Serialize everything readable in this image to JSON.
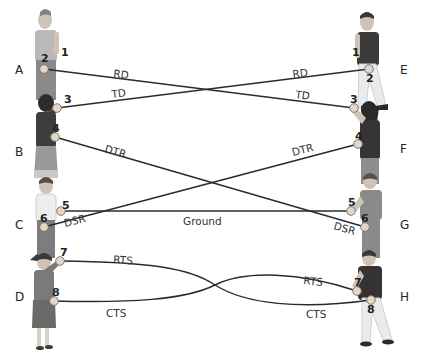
{
  "diagram": {
    "left_rows": [
      {
        "letter": "A",
        "x": 15,
        "y": 74
      },
      {
        "letter": "B",
        "x": 15,
        "y": 156
      },
      {
        "letter": "C",
        "x": 15,
        "y": 229
      },
      {
        "letter": "D",
        "x": 15,
        "y": 301
      }
    ],
    "right_rows": [
      {
        "letter": "E",
        "x": 400,
        "y": 74
      },
      {
        "letter": "F",
        "x": 400,
        "y": 153
      },
      {
        "letter": "G",
        "x": 400,
        "y": 229
      },
      {
        "letter": "H",
        "x": 400,
        "y": 301
      }
    ],
    "left_pins": [
      {
        "num": "1",
        "label_x": 61,
        "label_y": 56,
        "x": null,
        "y": null
      },
      {
        "num": "2",
        "label_x": 41,
        "label_y": 62,
        "x": 44,
        "y": 69
      },
      {
        "num": "3",
        "label_x": 64,
        "label_y": 103,
        "x": 57,
        "y": 108
      },
      {
        "num": "4",
        "label_x": 52,
        "label_y": 132,
        "x": 55,
        "y": 137
      },
      {
        "num": "5",
        "label_x": 62,
        "label_y": 209,
        "x": 61,
        "y": 211
      },
      {
        "num": "6",
        "label_x": 40,
        "label_y": 222,
        "x": 44,
        "y": 227
      },
      {
        "num": "7",
        "label_x": 60,
        "label_y": 256,
        "x": 60,
        "y": 261
      },
      {
        "num": "8",
        "label_x": 52,
        "label_y": 296,
        "x": 54,
        "y": 301
      }
    ],
    "right_pins": [
      {
        "num": "1",
        "label_x": 352,
        "label_y": 56,
        "x": null,
        "y": null
      },
      {
        "num": "2",
        "label_x": 366,
        "label_y": 82,
        "x": 369,
        "y": 69
      },
      {
        "num": "3",
        "label_x": 350,
        "label_y": 103,
        "x": 354,
        "y": 108
      },
      {
        "num": "4",
        "label_x": 355,
        "label_y": 140,
        "x": 358,
        "y": 144
      },
      {
        "num": "5",
        "label_x": 348,
        "label_y": 206,
        "x": 351,
        "y": 211
      },
      {
        "num": "6",
        "label_x": 361,
        "label_y": 222,
        "x": 365,
        "y": 227
      },
      {
        "num": "7",
        "label_x": 354,
        "label_y": 286,
        "x": 357,
        "y": 291
      },
      {
        "num": "8",
        "label_x": 367,
        "label_y": 313,
        "x": 371,
        "y": 300
      }
    ],
    "wires": [
      {
        "name": "RD",
        "from": "left-2",
        "to": "right-3",
        "path": "M44 69 L354 108"
      },
      {
        "name": "TD",
        "from": "left-3",
        "to": "right-2",
        "path": "M57 108 L369 69"
      },
      {
        "name": "DTR",
        "from": "left-4",
        "to": "right-6",
        "path": "M55 137 L365 227"
      },
      {
        "name": "DTR",
        "from": "right-4",
        "to": "left-6",
        "path": "M358 144 L44 227"
      },
      {
        "name": "Ground",
        "from": "left-5",
        "to": "right-5",
        "path": "M61 211 L351 211"
      },
      {
        "name": "RTS",
        "from": "left-7",
        "to": "right-8",
        "path": "M60 261 C 150 262, 190 268, 215 285 C 245 304, 300 310, 371 300"
      },
      {
        "name": "CTS",
        "from": "left-8",
        "to": "right-7",
        "path": "M54 301 C 130 303, 185 300, 215 285 C 245 270, 300 272, 357 291"
      }
    ],
    "signal_labels": [
      {
        "text": "RD",
        "x": 113,
        "y": 77,
        "rot": 7
      },
      {
        "text": "TD",
        "x": 112,
        "y": 98,
        "rot": -7
      },
      {
        "text": "RD",
        "x": 293,
        "y": 78,
        "rot": -7
      },
      {
        "text": "TD",
        "x": 295,
        "y": 98,
        "rot": 7
      },
      {
        "text": "DTR",
        "x": 104,
        "y": 152,
        "rot": 16
      },
      {
        "text": "DTR",
        "x": 293,
        "y": 156,
        "rot": -14
      },
      {
        "text": "DSR",
        "x": 65,
        "y": 227,
        "rot": -14
      },
      {
        "text": "DSR",
        "x": 333,
        "y": 229,
        "rot": 16
      },
      {
        "text": "Ground",
        "x": 183,
        "y": 225,
        "rot": 0
      },
      {
        "text": "RTS",
        "x": 113,
        "y": 263,
        "rot": 4
      },
      {
        "text": "CTS",
        "x": 106,
        "y": 317,
        "rot": 0
      },
      {
        "text": "RTS",
        "x": 303,
        "y": 284,
        "rot": 6
      },
      {
        "text": "CTS",
        "x": 306,
        "y": 318,
        "rot": 0
      }
    ]
  },
  "people": {
    "left": [
      {
        "row": "A",
        "shirt": "#b9b9b9",
        "pants": "#8a8a8a",
        "skin": "#c8b8a8"
      },
      {
        "row": "B",
        "shirt": "#3d3d3d",
        "skirt": "#9a9a9a",
        "skin": "#c8b8a8"
      },
      {
        "row": "C",
        "shirt": "#e8e8e8",
        "pants": "#7d7d7d",
        "skin": "#c8b8a8"
      },
      {
        "row": "D",
        "shirt": "#7a7a7a",
        "skirt": "#6a6a6a",
        "skin": "#c8b8a8"
      }
    ],
    "right": [
      {
        "row": "E",
        "shirt": "#3a3a3a",
        "pants": "#e8e8e8",
        "skin": "#c8b8a8"
      },
      {
        "row": "F",
        "shirt": "#353535",
        "pants": "#8d8d8d",
        "skin": "#c8b8a8"
      },
      {
        "row": "G",
        "shirt": "#8a8a8a",
        "pants": "#8a8a8a",
        "skin": "#c8b8a8"
      },
      {
        "row": "H",
        "shirt": "#333333",
        "pants": "#e8e8e8",
        "skin": "#c8b8a8"
      }
    ]
  }
}
